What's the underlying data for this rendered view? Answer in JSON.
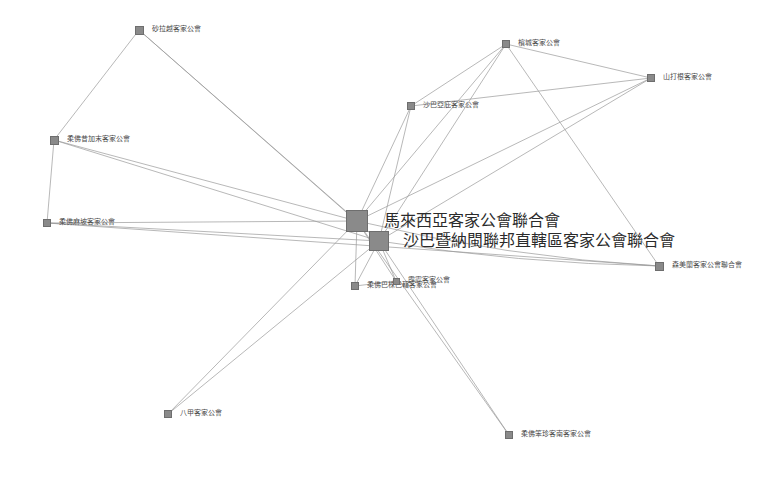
{
  "figure": {
    "type": "network-graph",
    "title": "",
    "background_color": "#ffffff",
    "node_color": "#8a8a8a",
    "node_border_color": "#6e6e6e",
    "edge_color": "#9a9a9a",
    "label_color": "#3a3a3a",
    "width": 780,
    "height": 479
  },
  "chart_data": {
    "type": "network",
    "title": "",
    "node_count": 13,
    "edge_count": 31,
    "nodes": [
      {
        "id": "n0",
        "label": "馬來西亞客家公會聯合會",
        "x": 357,
        "y": 221,
        "size": 22,
        "label_size": "hub",
        "label_dx": 16,
        "label_dy": -8
      },
      {
        "id": "n1",
        "label": "沙巴暨納閩聯邦直轄區客家公會聯合會",
        "x": 379,
        "y": 241,
        "size": 20,
        "label_size": "hub",
        "label_dx": 14,
        "label_dy": -8
      },
      {
        "id": "n2",
        "label": "砂拉越客家公會",
        "x": 139,
        "y": 30,
        "size": 9,
        "label_size": "small",
        "label_dx": 8,
        "label_dy": -4
      },
      {
        "id": "n3",
        "label": "柔佛昔加末客家公會",
        "x": 54,
        "y": 140,
        "size": 9,
        "label_size": "small",
        "label_dx": 8,
        "label_dy": -4
      },
      {
        "id": "n4",
        "label": "柔佛麻坡客家公會",
        "x": 47,
        "y": 223,
        "size": 8,
        "label_size": "small",
        "label_dx": 8,
        "label_dy": -4
      },
      {
        "id": "n5",
        "label": "檳城客家公會",
        "x": 506,
        "y": 44,
        "size": 8,
        "label_size": "small",
        "label_dx": 8,
        "label_dy": -4
      },
      {
        "id": "n6",
        "label": "山打根客家公會",
        "x": 651,
        "y": 78,
        "size": 8,
        "label_size": "small",
        "label_dx": 8,
        "label_dy": -4
      },
      {
        "id": "n7",
        "label": "沙巴亞庇客家公會",
        "x": 411,
        "y": 106,
        "size": 8,
        "label_size": "small",
        "label_dx": 8,
        "label_dy": -4
      },
      {
        "id": "n8",
        "label": "森美蘭客家公會聯合會",
        "x": 659,
        "y": 266,
        "size": 9,
        "label_size": "small",
        "label_dx": 8,
        "label_dy": -4
      },
      {
        "id": "n9",
        "label": "柔佛巴株巴轄客家公會",
        "x": 355,
        "y": 286,
        "size": 8,
        "label_size": "small",
        "label_dx": 8,
        "label_dy": -4
      },
      {
        "id": "n10",
        "label": "霹靂客家公會",
        "x": 396,
        "y": 281,
        "size": 7,
        "label_size": "small",
        "label_dx": 8,
        "label_dy": -4
      },
      {
        "id": "n11",
        "label": "八甲客家公會",
        "x": 168,
        "y": 414,
        "size": 8,
        "label_size": "small",
        "label_dx": 8,
        "label_dy": -4
      },
      {
        "id": "n12",
        "label": "柔佛笨珍客南客家公會",
        "x": 509,
        "y": 435,
        "size": 8,
        "label_size": "small",
        "label_dx": 8,
        "label_dy": -4
      }
    ],
    "edges": [
      {
        "source": "n2",
        "target": "n3",
        "curve": 0
      },
      {
        "source": "n2",
        "target": "n0",
        "curve": 0
      },
      {
        "source": "n3",
        "target": "n4",
        "curve": 0
      },
      {
        "source": "n3",
        "target": "n0",
        "curve": 0
      },
      {
        "source": "n3",
        "target": "n1",
        "curve": 0
      },
      {
        "source": "n4",
        "target": "n0",
        "curve": 0
      },
      {
        "source": "n4",
        "target": "n1",
        "curve": 0
      },
      {
        "source": "n4",
        "target": "n8",
        "curve": 0
      },
      {
        "source": "n5",
        "target": "n0",
        "curve": 0
      },
      {
        "source": "n5",
        "target": "n1",
        "curve": 0
      },
      {
        "source": "n5",
        "target": "n8",
        "curve": 0
      },
      {
        "source": "n6",
        "target": "n0",
        "curve": 0
      },
      {
        "source": "n6",
        "target": "n1",
        "curve": 0
      },
      {
        "source": "n6",
        "target": "n7",
        "curve": 0
      },
      {
        "source": "n7",
        "target": "n0",
        "curve": 0
      },
      {
        "source": "n7",
        "target": "n1",
        "curve": 0
      },
      {
        "source": "n7",
        "target": "n5",
        "curve": 0
      },
      {
        "source": "n8",
        "target": "n0",
        "curve": -14
      },
      {
        "source": "n8",
        "target": "n1",
        "curve": -10
      },
      {
        "source": "n9",
        "target": "n0",
        "curve": 0
      },
      {
        "source": "n9",
        "target": "n1",
        "curve": 0
      },
      {
        "source": "n10",
        "target": "n0",
        "curve": 0
      },
      {
        "source": "n10",
        "target": "n1",
        "curve": 0
      },
      {
        "source": "n11",
        "target": "n0",
        "curve": 0
      },
      {
        "source": "n11",
        "target": "n1",
        "curve": 0
      },
      {
        "source": "n12",
        "target": "n0",
        "curve": 0
      },
      {
        "source": "n12",
        "target": "n1",
        "curve": 0
      },
      {
        "source": "n0",
        "target": "n1",
        "curve": 0
      },
      {
        "source": "n2",
        "target": "n1",
        "curve": 0
      },
      {
        "source": "n5",
        "target": "n6",
        "curve": 0
      },
      {
        "source": "n9",
        "target": "n10",
        "curve": 0
      }
    ]
  }
}
